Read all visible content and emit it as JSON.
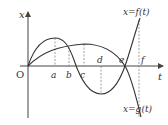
{
  "figure": {
    "axis_x_label": "t",
    "axis_y_label": "x",
    "origin_label": "O",
    "curve_f_label": "x=f(t)",
    "curve_g_label": "x=g(t)",
    "points": {
      "a": "a",
      "b": "b",
      "c": "c",
      "d": "d",
      "e": "e",
      "f": "f"
    },
    "colors": {
      "curve": "#333333",
      "axis": "#444444",
      "dashed": "#666666"
    }
  }
}
